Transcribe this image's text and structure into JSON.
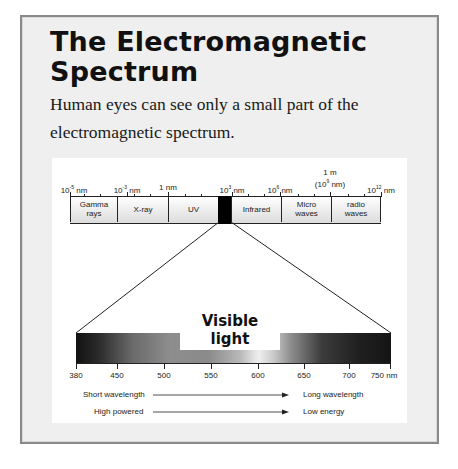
{
  "title": "The Electromagnetic Spectrum",
  "subtitle": "Human eyes can see only a small part of the electromagnetic spectrum.",
  "spectrum_scale": [
    {
      "base": "10",
      "exp": "-5",
      "unit": " nm",
      "x": 74
    },
    {
      "base": "10",
      "exp": "-3",
      "unit": " nm",
      "x": 127
    },
    {
      "base": "1 nm",
      "exp": "",
      "unit": "",
      "x": 168
    },
    {
      "base": "10",
      "exp": "3",
      "unit": " nm",
      "x": 232
    },
    {
      "base": "10",
      "exp": "6",
      "unit": " nm",
      "x": 280
    },
    {
      "base": "1 m",
      "line2_base": "(10",
      "line2_exp": "9",
      "line2_unit": " nm)",
      "x": 330
    },
    {
      "base": "10",
      "exp": "12",
      "unit": " nm",
      "x": 381
    }
  ],
  "bands": [
    {
      "label": "Gamma rays",
      "left": 70,
      "width": 47
    },
    {
      "label": "X-ray",
      "left": 117,
      "width": 51
    },
    {
      "label": "UV",
      "left": 168,
      "width": 50
    },
    {
      "label": "Infrared",
      "left": 231,
      "width": 50
    },
    {
      "label": "Micro waves",
      "left": 281,
      "width": 50
    },
    {
      "label": "radio waves",
      "left": 331,
      "width": 50
    }
  ],
  "visible_light": {
    "title": "Visible light",
    "axis_labels": [
      {
        "label": "380",
        "x": 76
      },
      {
        "label": "450",
        "x": 117
      },
      {
        "label": "500",
        "x": 164
      },
      {
        "label": "550",
        "x": 211
      },
      {
        "label": "600",
        "x": 258
      },
      {
        "label": "650",
        "x": 304
      },
      {
        "label": "700",
        "x": 349
      },
      {
        "label": "750 nm",
        "x": 384
      }
    ]
  },
  "legend": [
    {
      "left_text": "Short wavelength",
      "right_text": "Long wavelength"
    },
    {
      "left_text": "High powered",
      "right_text": "Low energy"
    }
  ],
  "colors": {
    "card_bg": "#efefef",
    "card_border": "#8a8a8a",
    "visible_slot": "#000000"
  }
}
